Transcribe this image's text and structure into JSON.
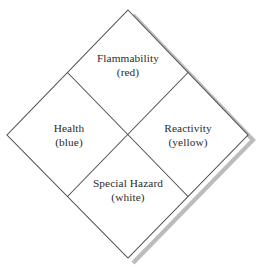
{
  "figure": {
    "background_color": "#ffffff",
    "line_color": "#4a4a4a",
    "shadow_color": "#b8b8b8",
    "text_color": "#2b2b2b"
  },
  "diamond": {
    "vertices": {
      "top": {
        "x": 128,
        "y": 10
      },
      "right": {
        "x": 248,
        "y": 135
      },
      "bottom": {
        "x": 128,
        "y": 258
      },
      "left": {
        "x": 7,
        "y": 135
      }
    },
    "center": {
      "x": 128,
      "y": 134
    },
    "shadow_offset": {
      "x": 5,
      "y": 5
    }
  },
  "quadrants": [
    {
      "id": "flammability",
      "position": "top",
      "name": "Flammability",
      "color_word": "(red)",
      "center": {
        "x": 128,
        "y": 65
      }
    },
    {
      "id": "health",
      "position": "left",
      "name": "Health",
      "color_word": "(blue)",
      "center": {
        "x": 69,
        "y": 135
      }
    },
    {
      "id": "reactivity",
      "position": "right",
      "name": "Reactivity",
      "color_word": "(yellow)",
      "center": {
        "x": 188,
        "y": 135
      }
    },
    {
      "id": "special_hazard",
      "position": "bottom",
      "name": "Special Hazard",
      "color_word": "(white)",
      "center": {
        "x": 128,
        "y": 190
      }
    }
  ]
}
